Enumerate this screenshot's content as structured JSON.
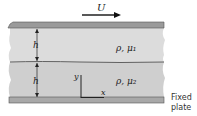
{
  "figure": {
    "velocity_label": "U",
    "thickness_label_upper": "h",
    "thickness_label_lower": "h",
    "fluid_upper": "ρ, μ₁",
    "fluid_lower": "ρ, μ₂",
    "axis_y": "y",
    "axis_x": "x",
    "fixed_plate_line1": "Fixed",
    "fixed_plate_line2": "plate"
  },
  "colors": {
    "plate": "#9a9a9a",
    "fluid": "#d6d6d6",
    "line": "#333333"
  }
}
